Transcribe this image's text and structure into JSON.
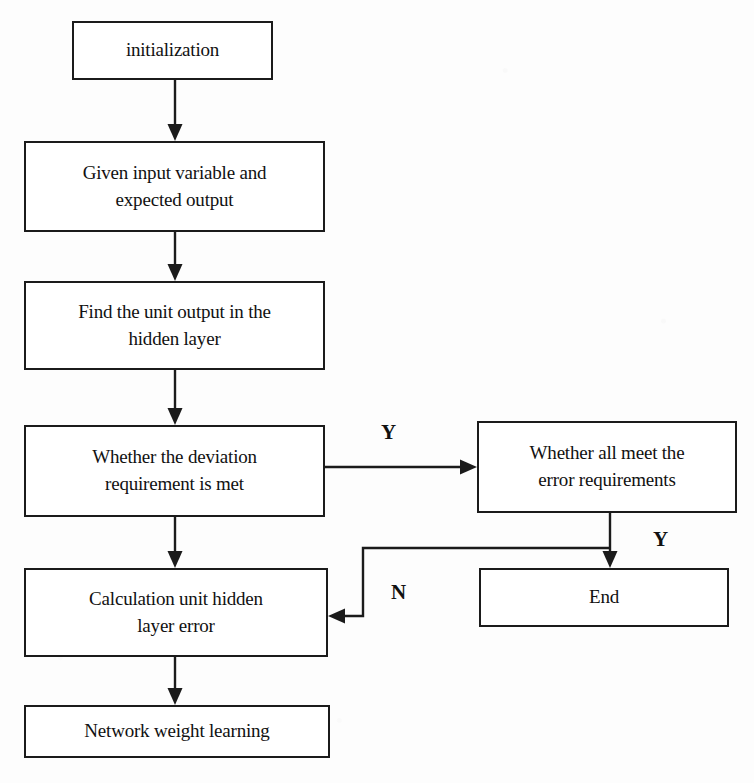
{
  "diagram": {
    "background_color": "#fdfdfd",
    "stroke_color": "#1b1b1b"
  },
  "nodes": [
    {
      "id": "initialization",
      "label": "initialization"
    },
    {
      "id": "given-input",
      "label": "Given input variable and\nexpected output"
    },
    {
      "id": "find-unit-output",
      "label": "Find the unit output in the\nhidden layer"
    },
    {
      "id": "deviation-check",
      "label": "Whether the deviation\nrequirement is met"
    },
    {
      "id": "error-check",
      "label": "Whether all meet the\nerror requirements"
    },
    {
      "id": "end",
      "label": "End"
    },
    {
      "id": "calculation",
      "label": "Calculation unit hidden\nlayer error"
    },
    {
      "id": "network-weight",
      "label": "Network weight learning"
    }
  ],
  "edge_labels": {
    "deviation_yes": "Y",
    "error_yes": "Y",
    "error_no": "N"
  }
}
